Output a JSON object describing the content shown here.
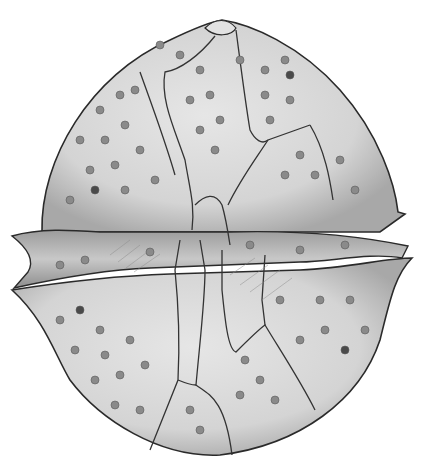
{
  "illustration": {
    "subject": "dinoflagellate theca (pencil drawing)",
    "colors": {
      "background": "#ffffff",
      "body_fill": "#d6d6d6",
      "body_light": "#e4e4e4",
      "outline": "#2a2a2a",
      "suture": "#3a3a3a",
      "pore": "#8a8a8a",
      "pore_dark": "#4a4a4a",
      "shade": "#9a9a9a"
    }
  }
}
